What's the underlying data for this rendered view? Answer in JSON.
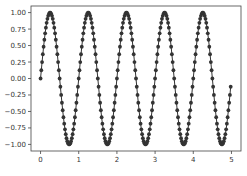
{
  "chart_data": {
    "type": "line",
    "title": "",
    "xlabel": "",
    "ylabel": "",
    "xlim": [
      -0.25,
      5.25
    ],
    "ylim": [
      -1.1,
      1.1
    ],
    "grid": false,
    "legend": null,
    "marker": "o",
    "color": "#333333",
    "x_ticks": [
      0,
      1,
      2,
      3,
      4,
      5
    ],
    "x_tick_labels": [
      "0",
      "1",
      "2",
      "3",
      "4",
      "5"
    ],
    "y_ticks": [
      1.0,
      0.75,
      0.5,
      0.25,
      0.0,
      -0.25,
      -0.5,
      -0.75,
      -1.0
    ],
    "y_tick_labels": [
      "1.00",
      "0.75",
      "0.50",
      "0.25",
      "0.00",
      "−0.25",
      "−0.50",
      "−0.75",
      "−1.00"
    ],
    "series": [
      {
        "name": "sin(2πx)",
        "x_start": 0,
        "x_step": 0.02,
        "y": [
          0,
          0.125,
          0.249,
          0.368,
          0.482,
          0.588,
          0.685,
          0.771,
          0.844,
          0.905,
          0.951,
          0.982,
          0.998,
          0.998,
          0.982,
          0.951,
          0.905,
          0.844,
          0.771,
          0.685,
          0.588,
          0.482,
          0.368,
          0.249,
          0.125,
          0,
          -0.125,
          -0.249,
          -0.368,
          -0.482,
          -0.588,
          -0.685,
          -0.771,
          -0.844,
          -0.905,
          -0.951,
          -0.982,
          -0.998,
          -0.998,
          -0.982,
          -0.951,
          -0.905,
          -0.844,
          -0.771,
          -0.685,
          -0.588,
          -0.482,
          -0.368,
          -0.249,
          -0.125,
          0,
          0.125,
          0.249,
          0.368,
          0.482,
          0.588,
          0.685,
          0.771,
          0.844,
          0.905,
          0.951,
          0.982,
          0.998,
          0.998,
          0.982,
          0.951,
          0.905,
          0.844,
          0.771,
          0.685,
          0.588,
          0.482,
          0.368,
          0.249,
          0.125,
          0,
          -0.125,
          -0.249,
          -0.368,
          -0.482,
          -0.588,
          -0.685,
          -0.771,
          -0.844,
          -0.905,
          -0.951,
          -0.982,
          -0.998,
          -0.998,
          -0.982,
          -0.951,
          -0.905,
          -0.844,
          -0.771,
          -0.685,
          -0.588,
          -0.482,
          -0.368,
          -0.249,
          -0.125,
          0,
          0.125,
          0.249,
          0.368,
          0.482,
          0.588,
          0.685,
          0.771,
          0.844,
          0.905,
          0.951,
          0.982,
          0.998,
          0.998,
          0.982,
          0.951,
          0.905,
          0.844,
          0.771,
          0.685,
          0.588,
          0.482,
          0.368,
          0.249,
          0.125,
          0,
          -0.125,
          -0.249,
          -0.368,
          -0.482,
          -0.588,
          -0.685,
          -0.771,
          -0.844,
          -0.905,
          -0.951,
          -0.982,
          -0.998,
          -0.998,
          -0.982,
          -0.951,
          -0.905,
          -0.844,
          -0.771,
          -0.685,
          -0.588,
          -0.482,
          -0.368,
          -0.249,
          -0.125,
          0,
          0.125,
          0.249,
          0.368,
          0.482,
          0.588,
          0.685,
          0.771,
          0.844,
          0.905,
          0.951,
          0.982,
          0.998,
          0.998,
          0.982,
          0.951,
          0.905,
          0.844,
          0.771,
          0.685,
          0.588,
          0.482,
          0.368,
          0.249,
          0.125,
          0,
          -0.125,
          -0.249,
          -0.368,
          -0.482,
          -0.588,
          -0.685,
          -0.771,
          -0.844,
          -0.905,
          -0.951,
          -0.982,
          -0.998,
          -0.998,
          -0.982,
          -0.951,
          -0.905,
          -0.844,
          -0.771,
          -0.685,
          -0.588,
          -0.482,
          -0.368,
          -0.249,
          -0.125,
          0,
          0.125,
          0.249,
          0.368,
          0.482,
          0.588,
          0.685,
          0.771,
          0.844,
          0.905,
          0.951,
          0.982,
          0.998,
          0.998,
          0.982,
          0.951,
          0.905,
          0.844,
          0.771,
          0.685,
          0.588,
          0.482,
          0.368,
          0.249,
          0.125,
          0,
          -0.125,
          -0.249,
          -0.368,
          -0.482,
          -0.588,
          -0.685,
          -0.771,
          -0.844,
          -0.905,
          -0.951,
          -0.982,
          -0.998,
          -0.998,
          -0.982,
          -0.951,
          -0.905,
          -0.844,
          -0.771,
          -0.685,
          -0.588,
          -0.482,
          -0.368,
          -0.249,
          -0.125
        ]
      }
    ]
  },
  "layout": {
    "axes_box": {
      "left": 31,
      "top": 6,
      "right": 241,
      "bottom": 151
    }
  }
}
